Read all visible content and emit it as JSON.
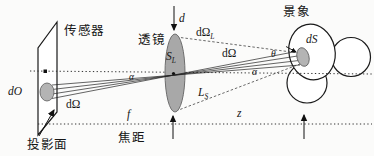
{
  "figure": {
    "colors": {
      "background": "#fbfbfa",
      "line": "#1a1a1a",
      "lens_fill": "#a8a8a8",
      "patch_fill": "#b4b4b4"
    },
    "labels": {
      "sensor": "传感器",
      "lens": "透镜",
      "scene": "景象",
      "projection_plane": "投影面",
      "focal_length_cn": "焦距",
      "focal_symbol": "f",
      "distance_symbol": "z",
      "aperture_symbol": "d",
      "image_patch": "dO",
      "solid_angle_left": "dΩ",
      "solid_angle_right": "dΩ",
      "solid_angle_lens_main": "dΩ",
      "solid_angle_lens_sub": "L",
      "scene_patch": "dS",
      "lens_area_main": "S",
      "lens_area_sub": "L",
      "scene_distance_main": "L",
      "scene_distance_sub": "S",
      "theta": "θ",
      "alpha_left": "α",
      "alpha_right": "α"
    }
  }
}
